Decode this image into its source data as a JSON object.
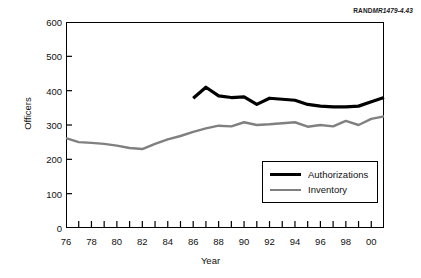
{
  "source_tag": {
    "bold": "RAND",
    "italic": "MR1479-4.43"
  },
  "chart_data": {
    "type": "line",
    "title": "",
    "xlabel": "Year",
    "ylabel": "Officers",
    "xlim": [
      1976,
      2001
    ],
    "ylim": [
      0,
      600
    ],
    "ytick_values": [
      0,
      100,
      200,
      300,
      400,
      500,
      600
    ],
    "ytick_labels": [
      "0",
      "100",
      "200",
      "300",
      "400",
      "500",
      "600"
    ],
    "xtick_values": [
      1976,
      1977,
      1978,
      1979,
      1980,
      1981,
      1982,
      1983,
      1984,
      1985,
      1986,
      1987,
      1988,
      1989,
      1990,
      1991,
      1992,
      1993,
      1994,
      1995,
      1996,
      1997,
      1998,
      1999,
      2000,
      2001
    ],
    "xtick_labeled": [
      1976,
      1978,
      1980,
      1982,
      1984,
      1986,
      1988,
      1990,
      1992,
      1994,
      1996,
      1998,
      2000
    ],
    "xtick_labels": [
      "76",
      "78",
      "80",
      "82",
      "84",
      "86",
      "88",
      "90",
      "92",
      "94",
      "96",
      "98",
      "00"
    ],
    "grid": false,
    "legend_position": "lower right",
    "series": [
      {
        "name": "Authorizations",
        "color": "#000000",
        "linewidth": 3.2,
        "x": [
          1986,
          1987,
          1988,
          1989,
          1990,
          1991,
          1992,
          1993,
          1994,
          1995,
          1996,
          1997,
          1998,
          1999,
          2000,
          2001
        ],
        "values": [
          378,
          410,
          385,
          380,
          382,
          360,
          378,
          375,
          372,
          360,
          355,
          353,
          353,
          355,
          368,
          380
        ]
      },
      {
        "name": "Inventory",
        "color": "#808080",
        "linewidth": 2.4,
        "x": [
          1976,
          1977,
          1978,
          1979,
          1980,
          1981,
          1982,
          1983,
          1984,
          1985,
          1986,
          1987,
          1988,
          1989,
          1990,
          1991,
          1992,
          1993,
          1994,
          1995,
          1996,
          1997,
          1998,
          1999,
          2000,
          2001
        ],
        "values": [
          262,
          250,
          248,
          245,
          240,
          233,
          230,
          245,
          258,
          268,
          280,
          290,
          298,
          296,
          308,
          300,
          302,
          305,
          308,
          295,
          300,
          296,
          312,
          300,
          318,
          325
        ]
      }
    ]
  },
  "legend": {
    "items": [
      {
        "label": "Authorizations"
      },
      {
        "label": "Inventory"
      }
    ]
  }
}
